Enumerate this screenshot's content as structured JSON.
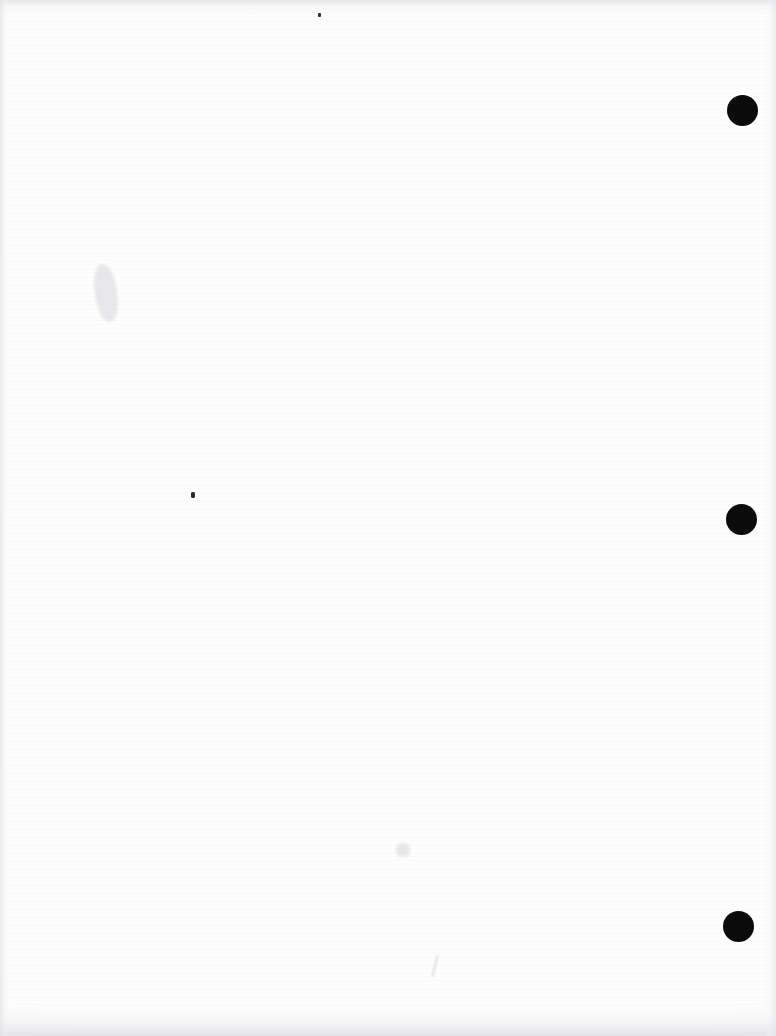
{
  "document": {
    "kind": "scanned-page",
    "page_label": "",
    "body_text": "",
    "note": "",
    "width_px": 776,
    "height_px": 1036,
    "background_color": "#fefefe",
    "ink_color": "#0b0b0b"
  },
  "marks": {
    "registration_label": "",
    "items": [
      {
        "name": "registration-mark-top",
        "cx": 742,
        "cy": 110,
        "r": 15.5,
        "color": "#0b0b0b"
      },
      {
        "name": "registration-mark-middle",
        "cx": 741,
        "cy": 519,
        "r": 15.5,
        "color": "#0b0b0b"
      },
      {
        "name": "registration-mark-bottom",
        "cx": 738,
        "cy": 926,
        "r": 15.5,
        "color": "#0b0b0b"
      }
    ]
  },
  "artifacts": {
    "specks": [
      {
        "name": "ink-speck-center-left",
        "x": 191,
        "y": 492,
        "w": 4,
        "h": 6
      },
      {
        "name": "ink-speck-top-center",
        "x": 318,
        "y": 13,
        "w": 3,
        "h": 4
      }
    ],
    "smudges": [
      {
        "name": "paper-smudge-left-margin",
        "x": 95,
        "y": 264,
        "w": 22,
        "h": 58,
        "rotate": -8
      },
      {
        "name": "paper-smudge-lower-center",
        "x": 396,
        "y": 843,
        "w": 14,
        "h": 14,
        "rotate": 0
      }
    ],
    "pen_strokes": [
      {
        "name": "pen-stroke-bottom-center",
        "x": 434,
        "y": 955,
        "w": 2,
        "h": 22,
        "rotate": 14
      }
    ]
  }
}
